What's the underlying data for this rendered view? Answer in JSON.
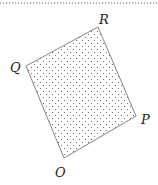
{
  "diagram": {
    "type": "quadrilateral",
    "fill": "dotted",
    "colors": {
      "edge": "#777777",
      "dots": "#555555",
      "label": "#222222",
      "rule": "#666666"
    },
    "vertices": [
      {
        "name": "O",
        "x": 64,
        "y": 158,
        "label_x": 55,
        "label_y": 177
      },
      {
        "name": "P",
        "x": 136,
        "y": 116,
        "label_x": 141,
        "label_y": 124
      },
      {
        "name": "R",
        "x": 98,
        "y": 27,
        "label_x": 99,
        "label_y": 24
      },
      {
        "name": "Q",
        "x": 26,
        "y": 66,
        "label_x": 10,
        "label_y": 72
      }
    ],
    "labels": {
      "O": "O",
      "P": "P",
      "Q": "Q",
      "R": "R"
    }
  }
}
